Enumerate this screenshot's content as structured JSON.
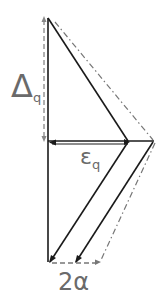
{
  "diagram": {
    "labels": {
      "delta": {
        "main": "Δ",
        "sub": "q"
      },
      "epsilon": {
        "main": "ε",
        "sub": "q"
      },
      "alpha": {
        "main": "2α"
      }
    },
    "colors": {
      "solid": "#1a1a1a",
      "dashed": "#777777",
      "label": "#6a6a6a"
    }
  }
}
